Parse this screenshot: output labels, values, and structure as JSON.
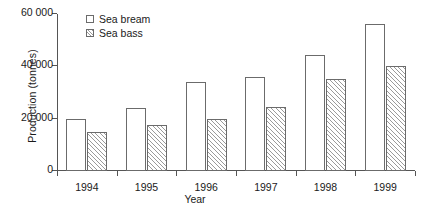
{
  "chart_data": {
    "type": "bar",
    "title": "",
    "subtitle": "",
    "xlabel": "Year",
    "ylabel": "Production (tonnes)",
    "categories": [
      "1994",
      "1995",
      "1996",
      "1997",
      "1998",
      "1999"
    ],
    "series": [
      {
        "name": "Sea bream",
        "values": [
          20000,
          24000,
          34000,
          36000,
          44500,
          56000
        ]
      },
      {
        "name": "Sea bass",
        "values": [
          15000,
          17500,
          20000,
          24500,
          35000,
          40000
        ]
      }
    ],
    "ylim": [
      0,
      60000
    ],
    "yticks": [
      0,
      20000,
      40000,
      60000
    ],
    "ytick_labels": [
      "0",
      "20 000",
      "40 000",
      "60 000"
    ],
    "grid": false,
    "legend_position": "top-left",
    "colors": {
      "bream_fill": "#ffffff",
      "bass_hatch": "#9a9a9a",
      "bar_outline": "#6b6b6b",
      "axis": "#555555",
      "text": "#1a1a1a"
    }
  }
}
